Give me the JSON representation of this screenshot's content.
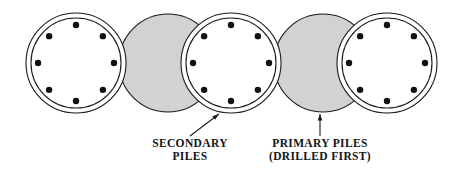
{
  "figure": {
    "background_color": "#ffffff",
    "width": 456,
    "height": 180
  },
  "styles": {
    "stroke_color": "#1a1a1a",
    "primary_fill": "#d2d2d2",
    "secondary_fill": "#ffffff",
    "rebar_color": "#111111",
    "text_color": "#141414"
  },
  "piles": [
    {
      "index": 1,
      "kind": "secondary",
      "fill": "#ffffff",
      "cx": 76,
      "cy": 63,
      "outer_r": 50,
      "inner_r": 45,
      "rebar_r": 38,
      "rebar_count": 8,
      "rebar_radius": 3.2,
      "double_ring": true
    },
    {
      "index": 2,
      "kind": "primary",
      "fill": "#d2d2d2",
      "cx": 168,
      "cy": 63,
      "outer_r": 49,
      "inner_r": 0,
      "rebar_r": 0,
      "rebar_count": 0,
      "rebar_radius": 0,
      "double_ring": false
    },
    {
      "index": 3,
      "kind": "secondary",
      "fill": "#ffffff",
      "cx": 231,
      "cy": 63,
      "outer_r": 50,
      "inner_r": 45,
      "rebar_r": 38,
      "rebar_count": 8,
      "rebar_radius": 3.2,
      "double_ring": true
    },
    {
      "index": 4,
      "kind": "primary",
      "fill": "#d2d2d2",
      "cx": 323,
      "cy": 63,
      "outer_r": 49,
      "inner_r": 0,
      "rebar_r": 0,
      "rebar_count": 0,
      "rebar_radius": 0,
      "double_ring": false
    },
    {
      "index": 5,
      "kind": "secondary",
      "fill": "#ffffff",
      "cx": 387,
      "cy": 63,
      "outer_r": 50,
      "inner_r": 45,
      "rebar_r": 38,
      "rebar_count": 8,
      "rebar_radius": 3.2,
      "double_ring": true
    }
  ],
  "annotations": {
    "secondary": {
      "lines": [
        "SECONDARY",
        "PILES"
      ],
      "line1": "SECONDARY",
      "line2": "PILES",
      "leader": {
        "type": "diagonal-arrow",
        "x1": 190,
        "y1": 136,
        "x2": 219,
        "y2": 114
      }
    },
    "primary": {
      "lines": [
        "PRIMARY PILES",
        "(DRILLED FIRST)"
      ],
      "line1": "PRIMARY PILES",
      "line2": "(DRILLED FIRST)",
      "leader": {
        "type": "vertical-arrow",
        "x1": 320,
        "y1": 136,
        "x2": 320,
        "y2": 114
      }
    }
  }
}
